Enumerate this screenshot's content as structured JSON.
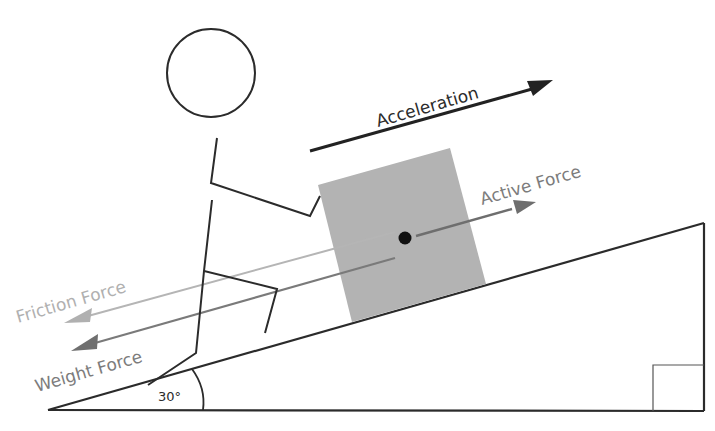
{
  "diagram": {
    "labels": {
      "acceleration": "Acceleration",
      "active_force": "Active Force",
      "friction_force": "Friction Force",
      "weight_force": "Weight Force",
      "angle": "30°"
    },
    "colors": {
      "line": "#2b2b2b",
      "box_fill": "#b3b3b3",
      "active_force": "#6e6e6e",
      "friction_force": "#b5b5b5",
      "weight_force": "#7a7a7a",
      "acceleration": "#222222",
      "label_gray": "#7c7c7c",
      "friction_label": "#b0b0b0"
    },
    "incline": {
      "angle_deg": 30,
      "right_angle_marker": true
    }
  }
}
